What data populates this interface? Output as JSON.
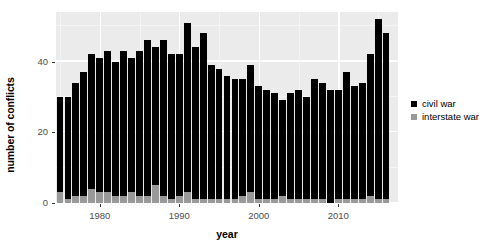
{
  "chart_data": {
    "type": "bar",
    "subtype": "stacked",
    "title": "",
    "xlabel": "year",
    "ylabel": "number of conflicts",
    "xlim": [
      1974.5,
      2017.5
    ],
    "ylim": [
      0,
      54
    ],
    "grid": true,
    "legend_position": "right",
    "ytick_labels": [
      "0",
      "20",
      "40"
    ],
    "ytick_values": [
      0,
      20,
      40
    ],
    "xtick_labels": [
      "1980",
      "1990",
      "2000",
      "2010"
    ],
    "xtick_values": [
      1980,
      1990,
      2000,
      2010
    ],
    "categories": [
      1975,
      1976,
      1977,
      1978,
      1979,
      1980,
      1981,
      1982,
      1983,
      1984,
      1985,
      1986,
      1987,
      1988,
      1989,
      1990,
      1991,
      1992,
      1993,
      1994,
      1995,
      1996,
      1997,
      1998,
      1999,
      2000,
      2001,
      2002,
      2003,
      2004,
      2005,
      2006,
      2007,
      2008,
      2009,
      2010,
      2011,
      2012,
      2013,
      2014,
      2015,
      2016
    ],
    "series": [
      {
        "name": "civil war",
        "color": "#000000",
        "values": [
          27,
          29,
          32,
          35,
          38,
          38,
          40,
          38,
          41,
          38,
          41,
          44,
          39,
          44,
          41,
          40,
          48,
          43,
          47,
          38,
          37,
          35,
          34,
          33,
          36,
          32,
          31,
          30,
          27,
          30,
          31,
          29,
          34,
          33,
          32,
          31,
          36,
          32,
          33,
          40,
          51,
          47
        ],
        "label": "civil war"
      },
      {
        "name": "interstate war",
        "color": "#999999",
        "values": [
          3,
          1,
          2,
          2,
          4,
          3,
          3,
          2,
          2,
          3,
          2,
          2,
          5,
          2,
          1,
          2,
          3,
          1,
          1,
          1,
          1,
          1,
          1,
          2,
          3,
          1,
          1,
          1,
          2,
          1,
          1,
          1,
          1,
          1,
          0,
          1,
          1,
          1,
          1,
          2,
          1,
          1
        ],
        "label": "interstate war"
      }
    ],
    "totals": [
      30,
      30,
      34,
      37,
      42,
      41,
      43,
      40,
      43,
      41,
      43,
      46,
      44,
      46,
      42,
      42,
      51,
      44,
      48,
      39,
      38,
      36,
      35,
      35,
      39,
      33,
      32,
      31,
      29,
      31,
      32,
      30,
      35,
      34,
      32,
      32,
      37,
      33,
      34,
      42,
      52,
      48
    ]
  },
  "legend": {
    "items": [
      {
        "label": "civil war"
      },
      {
        "label": "interstate war"
      }
    ]
  }
}
